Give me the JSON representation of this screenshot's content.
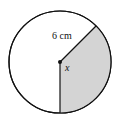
{
  "diagram": {
    "shape": "circle",
    "radius_label": "6 cm",
    "angle_label": "x",
    "shaded_sector": {
      "from_deg": 45,
      "to_deg": 180,
      "direction": "clockwise-from-upper-right-to-bottom"
    },
    "colors": {
      "outline": "#111111",
      "shade": "#d4d4d4",
      "background": "#ffffff"
    }
  }
}
